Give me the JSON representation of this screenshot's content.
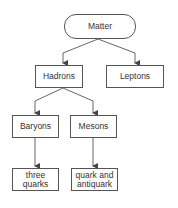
{
  "diagram": {
    "type": "hierarchy",
    "nodes": {
      "matter": {
        "label": "Matter"
      },
      "hadrons": {
        "label": "Hadrons"
      },
      "leptons": {
        "label": "Leptons"
      },
      "baryons": {
        "label": "Baryons"
      },
      "mesons": {
        "label": "Mesons"
      },
      "three_quarks": {
        "label": "three quarks"
      },
      "quark_antiquark": {
        "label": "quark and antiquark"
      }
    },
    "edges": [
      [
        "Matter",
        "Hadrons"
      ],
      [
        "Matter",
        "Leptons"
      ],
      [
        "Hadrons",
        "Baryons"
      ],
      [
        "Hadrons",
        "Mesons"
      ],
      [
        "Baryons",
        "three quarks"
      ],
      [
        "Mesons",
        "quark and antiquark"
      ]
    ]
  }
}
